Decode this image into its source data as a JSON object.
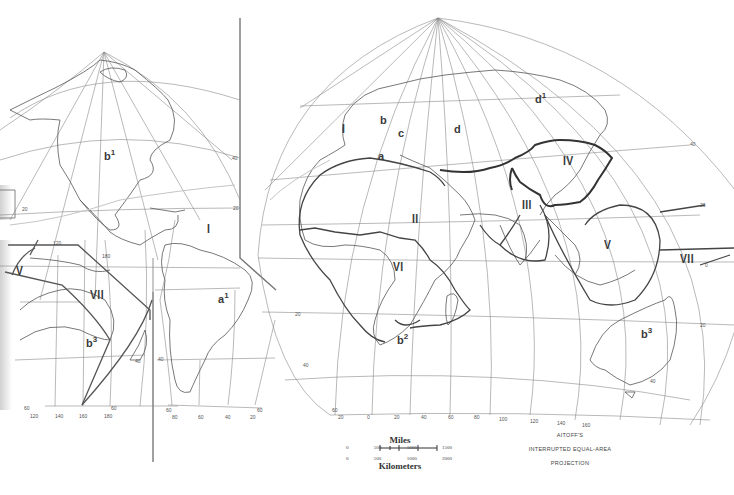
{
  "map": {
    "projection_title": [
      "AITOFF'S",
      "INTERRUPTED EQUAL-AREA",
      "PROJECTION"
    ],
    "scale": {
      "miles_label": "Miles",
      "miles_ticks": [
        "0",
        "500",
        "1000",
        "1500"
      ],
      "km_ticks": [
        "0",
        "500",
        "1000",
        "2000"
      ],
      "km_label": "Kilometers"
    },
    "region_labels": {
      "I_atlantic_west": "I",
      "I_atlantic_east": "I",
      "II": "II",
      "III": "III",
      "IV": "IV",
      "V_east": "V",
      "V_west": "V",
      "VI": "VI",
      "VII_east": "VII",
      "VII_west": "VII",
      "a": "a",
      "a1_base": "a",
      "a1_sup": "1",
      "b": "b",
      "b1_base": "b",
      "b1_sup": "1",
      "b2_base": "b",
      "b2_sup": "2",
      "b3_east_base": "b",
      "b3_east_sup": "3",
      "b3_west_base": "b",
      "b3_west_sup": "3",
      "c": "c",
      "d": "d",
      "d1_base": "d",
      "d1_sup": "1"
    },
    "graticule_labels": {
      "west_lat_40": "40",
      "west_lat_20": "20",
      "west_lat_20b": "20",
      "west_lon_120": "120",
      "west_lon_140": "140",
      "west_lon_160": "160",
      "west_lon_180": "180",
      "west_lon_180b": "180",
      "west_lat_40s": "40",
      "west_lat_60s": "60",
      "west_lat_60s_b": "60",
      "sa_lon_80": "80",
      "sa_lon_60": "60",
      "sa_lon_40": "40",
      "sa_lon_20": "20",
      "sa_lat_40s": "40",
      "sa_lat_60s": "60",
      "sa_lat_60s_b": "60",
      "east_lat_40": "40",
      "east_lat_20": "20",
      "east_lat_0": "0",
      "east_lat_20s": "20",
      "east_lat_40s": "40",
      "east_lat_60s": "60",
      "east_lon_20w": "20",
      "east_lon_0": "0",
      "east_lon_20": "20",
      "east_lon_40": "40",
      "east_lon_60": "60",
      "east_lon_80": "80",
      "east_lon_100": "100",
      "east_lon_120": "120",
      "east_lon_140": "140",
      "east_lon_160": "160",
      "east_lat_20_right": "20",
      "east_lat_40s_right": "40",
      "east_lat_0_right": "0"
    },
    "colors": {
      "coastline": "#555555",
      "graticule": "#8a8a8a",
      "region_boundary": "#444444",
      "divider": "#777777",
      "label": "#3a3a3a"
    }
  }
}
